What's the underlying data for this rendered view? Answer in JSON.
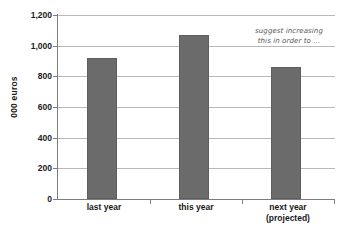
{
  "chart_data": {
    "type": "bar",
    "title": "",
    "subtitle": "",
    "xlabel": "",
    "ylabel": "000 euros",
    "categories": [
      "last year",
      "this year",
      "next year (projected)"
    ],
    "category_lines": [
      [
        "last year"
      ],
      [
        "this year"
      ],
      [
        "next year",
        "(projected)"
      ]
    ],
    "values": [
      920,
      1070,
      860
    ],
    "ylim": [
      0,
      1200
    ],
    "y_ticks": [
      0,
      200,
      400,
      600,
      800,
      1000,
      1200
    ],
    "y_tick_labels": [
      "0",
      "200",
      "400",
      "600",
      "800",
      "1,000",
      "1,200"
    ],
    "grid": true,
    "legend": "none",
    "series": [
      {
        "name": "euros",
        "values": [
          920,
          1070,
          860
        ]
      }
    ],
    "annotations": [
      {
        "text": "suggest increasing this in order to ...",
        "lines": [
          "suggest increasing",
          "this in order to ..."
        ],
        "style": "handwritten-italic"
      }
    ],
    "colors": {
      "bar_fill": "#6b6b6b",
      "bar_border": "#5d5d5d",
      "gridline": "#b9b9b9",
      "axis": "#7d7d7d",
      "text": "#1a1a1a",
      "annotation_text": "#555555",
      "background": "#ffffff"
    }
  }
}
